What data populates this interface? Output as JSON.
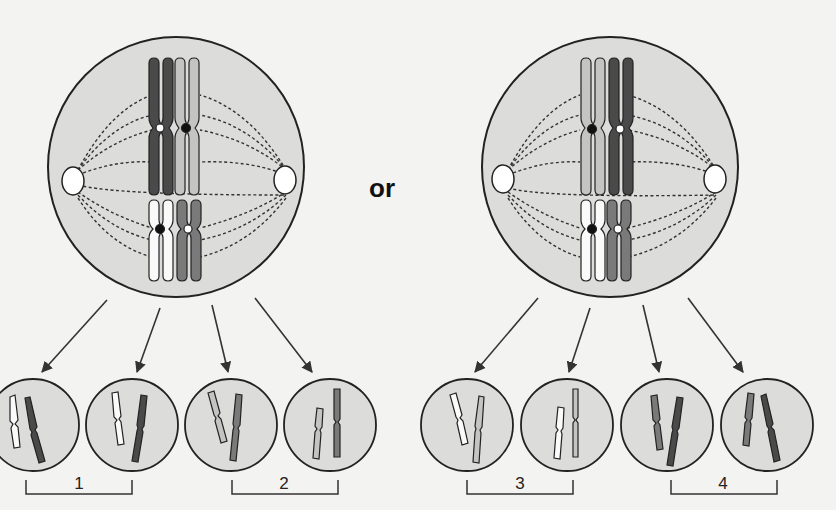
{
  "diagram": {
    "type": "meiosis-independent-assortment",
    "connector_text": "or",
    "colors": {
      "background": "#f3f3f1",
      "cell_fill": "#dcdcda",
      "cell_stroke": "#222222",
      "chrom_dark": "#4a4a4a",
      "chrom_light": "#c4c4c2",
      "chrom_white": "#fafafa",
      "chrom_mid": "#7a7a7a",
      "centriole": "#ffffff"
    },
    "parent_cells": [
      {
        "id": "left",
        "pairs": [
          {
            "position": "top",
            "left_chromatid": "dark",
            "right_chromatid": "light",
            "left_centromere": "white",
            "right_centromere": "black"
          },
          {
            "position": "bottom",
            "left_chromatid": "white",
            "right_chromatid": "mid",
            "left_centromere": "black",
            "right_centromere": "white"
          }
        ]
      },
      {
        "id": "right",
        "pairs": [
          {
            "position": "top",
            "left_chromatid": "light",
            "right_chromatid": "dark",
            "left_centromere": "black",
            "right_centromere": "white"
          },
          {
            "position": "bottom",
            "left_chromatid": "white",
            "right_chromatid": "mid",
            "left_centromere": "black",
            "right_centromere": "white"
          }
        ]
      }
    ],
    "daughter_cells": [
      {
        "group": "1",
        "small": "white",
        "large": "dark"
      },
      {
        "group": "1",
        "small": "white",
        "large": "dark"
      },
      {
        "group": "2",
        "small": "light",
        "large": "mid"
      },
      {
        "group": "2",
        "small": "light",
        "large": "mid"
      },
      {
        "group": "3",
        "small": "white",
        "large": "light"
      },
      {
        "group": "3",
        "small": "white",
        "large": "light"
      },
      {
        "group": "4",
        "small": "mid",
        "large": "dark"
      },
      {
        "group": "4",
        "small": "mid",
        "large": "dark"
      }
    ],
    "group_labels": [
      "1",
      "2",
      "3",
      "4"
    ]
  }
}
